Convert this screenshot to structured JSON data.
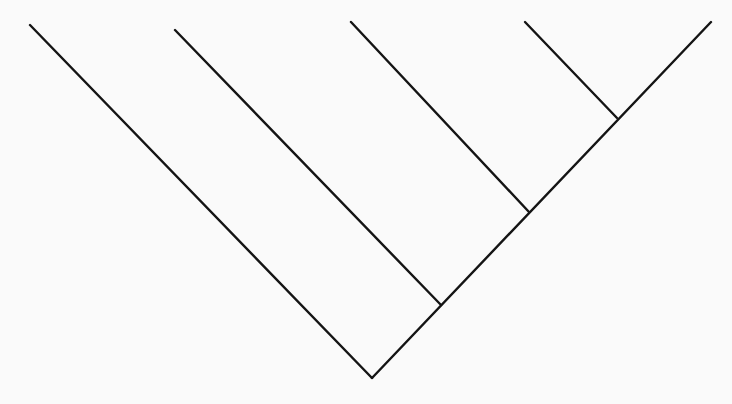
{
  "diagram": {
    "type": "cladogram",
    "background": "#fafafa",
    "stroke_color": "#141414",
    "stroke_width": 2.4,
    "root": [
      372,
      378
    ],
    "lines": [
      {
        "name": "branch-taxon-1",
        "from": [
          372,
          378
        ],
        "to": [
          30,
          25
        ]
      },
      {
        "name": "main-spine",
        "from": [
          372,
          378
        ],
        "to": [
          711,
          22
        ]
      },
      {
        "name": "branch-taxon-2",
        "from": [
          441,
          305
        ],
        "to": [
          175,
          30
        ]
      },
      {
        "name": "branch-taxon-3",
        "from": [
          529,
          212
        ],
        "to": [
          351,
          22
        ]
      },
      {
        "name": "branch-taxon-4",
        "from": [
          617,
          118
        ],
        "to": [
          525,
          22
        ]
      }
    ],
    "nodes": [
      {
        "name": "root-node",
        "at": [
          372,
          378
        ]
      },
      {
        "name": "node-1",
        "at": [
          441,
          305
        ]
      },
      {
        "name": "node-2",
        "at": [
          529,
          212
        ]
      },
      {
        "name": "node-3",
        "at": [
          617,
          118
        ]
      }
    ],
    "leaf_count": 5,
    "labels": []
  }
}
